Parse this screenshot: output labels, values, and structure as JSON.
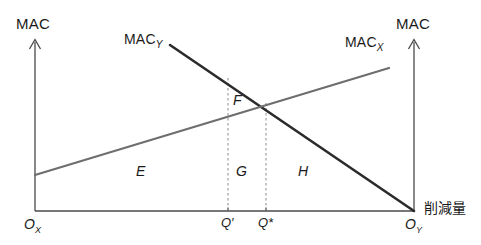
{
  "figure": {
    "type": "economics-diagram",
    "axes": {
      "left_axis_title": "MAC",
      "right_axis_title": "MAC",
      "horizontal_axis_label": "削減量",
      "left_origin": "O",
      "left_origin_sub": "X",
      "right_origin": "O",
      "right_origin_sub": "Y"
    },
    "curves": [
      {
        "name": "MAC",
        "sub": "Y",
        "label_x": 124,
        "label_y": 38,
        "direction": "downward-sloping-from-left"
      },
      {
        "name": "MAC",
        "sub": "X",
        "label_x": 345,
        "label_y": 41,
        "direction": "upward-sloping-from-left"
      }
    ],
    "tick_marks": [
      {
        "label": "Q′",
        "x": 228
      },
      {
        "label": "Q*",
        "x": 266
      }
    ],
    "areas": [
      {
        "label": "E",
        "x": 141,
        "y": 171
      },
      {
        "label": "F",
        "x": 237,
        "y": 100
      },
      {
        "label": "G",
        "x": 240,
        "y": 171
      },
      {
        "label": "H",
        "x": 303,
        "y": 171
      }
    ],
    "colors": {
      "axis": "#4a4a4a",
      "curve_mac_y": "#2b2b2b",
      "curve_mac_x": "#6e6e6e",
      "dashed_guide": "#8a8a8a",
      "text": "#1a1a1a",
      "background": "#ffffff"
    }
  }
}
